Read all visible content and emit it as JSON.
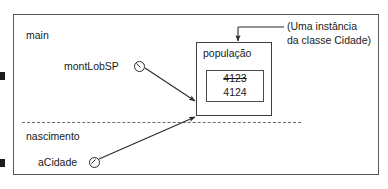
{
  "diagram": {
    "outer_region": {
      "upper_label": "main",
      "lower_label": "nascimento"
    },
    "variables": [
      {
        "name": "montLobSP",
        "marker": "reference-circle-icon"
      },
      {
        "name": "aCidade",
        "marker": "reference-circle-icon"
      }
    ],
    "object": {
      "field_label": "população",
      "value_old": "4123",
      "value_new": "4124"
    },
    "annotation": {
      "line1": "(Uma instância",
      "line2": "da classe Cidade)"
    },
    "icons": {
      "arrow_montlobsp": "arrow-icon",
      "arrow_acidade": "arrow-icon",
      "arrow_annotation": "arrow-down-icon",
      "divider": "dashed-divider-icon"
    },
    "colors": {
      "ink": "#1a1a1a",
      "frame": "#5a5a5a",
      "box": "#3d3d3d",
      "dashed": "#6b6b6b",
      "background": "#ffffff"
    }
  }
}
